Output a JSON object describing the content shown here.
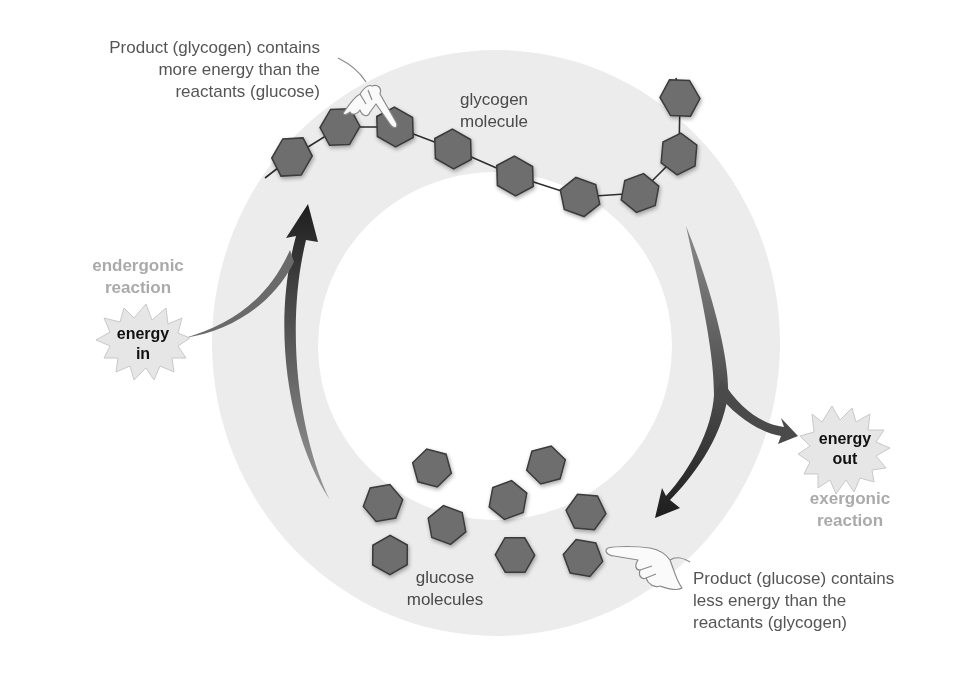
{
  "diagram": {
    "type": "cycle",
    "colors": {
      "ring": "#ececec",
      "background": "#ffffff",
      "molecule_fill": "#6e6e6e",
      "molecule_stroke": "#3a3a3a",
      "arrow": "#3a3a3a",
      "reaction_label": "#aaaaaa",
      "burst_fill": "#e6e6e6"
    },
    "glycogen": {
      "label_line1": "glycogen",
      "label_line2": "molecule",
      "note_line1": "Product (glycogen) contains",
      "note_line2": "more energy than the",
      "note_line3": "reactants (glucose)",
      "units": 11
    },
    "glucose": {
      "label_line1": "glucose",
      "label_line2": "molecules",
      "note_line1": "Product (glucose) contains",
      "note_line2": "less energy than the",
      "note_line3": "reactants (glycogen)",
      "units": 9
    },
    "endergonic": {
      "label_line1": "endergonic",
      "label_line2": "reaction",
      "burst_line1": "energy",
      "burst_line2": "in"
    },
    "exergonic": {
      "label_line1": "exergonic",
      "label_line2": "reaction",
      "burst_line1": "energy",
      "burst_line2": "out"
    },
    "icons": [
      "pointing-hand-icon",
      "pointing-hand-icon",
      "starburst-icon",
      "starburst-icon",
      "hexagon-molecule-icon"
    ]
  }
}
